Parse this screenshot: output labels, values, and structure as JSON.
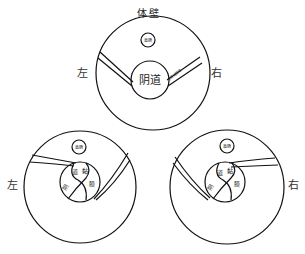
{
  "title": "体壁",
  "top": {
    "left_label": "左",
    "right_label": "右",
    "inner_label": "阴道",
    "small_label": "直肠",
    "band_label": "子宫阔韧带"
  },
  "bottom_left": {
    "side_label": "左",
    "small_label": "直肠",
    "inner_chars": [
      "阴",
      "道",
      "黏",
      "膜"
    ]
  },
  "bottom_right": {
    "side_label": "右",
    "small_label": "直肠",
    "inner_chars": [
      "阴",
      "道",
      "黏",
      "膜"
    ]
  }
}
